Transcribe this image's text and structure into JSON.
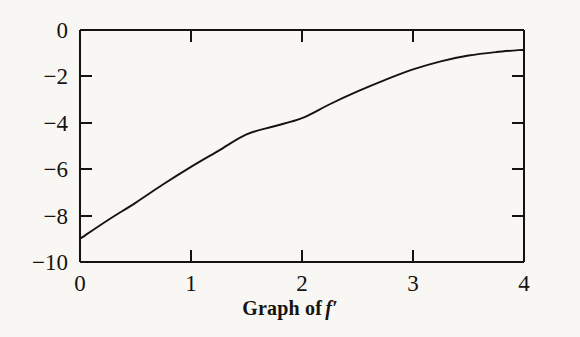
{
  "figure": {
    "background_color": "#f8f7f4",
    "ink_color": "#15130f",
    "caption_text": "Graph of",
    "caption_function": "f′"
  },
  "chart_data": {
    "type": "line",
    "xlabel": "",
    "ylabel": "",
    "xlim": [
      0,
      4
    ],
    "ylim": [
      -10,
      0
    ],
    "grid": false,
    "legend": null,
    "frame": "full-box",
    "tick_direction": "in",
    "x_ticks": [
      0,
      1,
      2,
      3,
      4
    ],
    "x_tick_labels": [
      "0",
      "1",
      "2",
      "3",
      "4"
    ],
    "y_ticks": [
      0,
      -2,
      -4,
      -6,
      -8,
      -10
    ],
    "y_tick_labels": [
      "0",
      "−2",
      "−4",
      "−6",
      "−8",
      "−10"
    ],
    "series": [
      {
        "name": "f′",
        "x": [
          0.0,
          0.25,
          0.5,
          0.75,
          1.0,
          1.25,
          1.5,
          1.75,
          2.0,
          2.25,
          2.5,
          2.75,
          3.0,
          3.25,
          3.5,
          3.75,
          4.0
        ],
        "y": [
          -9.0,
          -8.2,
          -7.45,
          -6.65,
          -5.9,
          -5.2,
          -4.5,
          -4.15,
          -3.8,
          -3.2,
          -2.65,
          -2.15,
          -1.7,
          -1.35,
          -1.1,
          -0.95,
          -0.85
        ]
      }
    ],
    "annotations": []
  },
  "axis_geometry": {
    "left_px": 80,
    "right_px": 524,
    "top_px": 30,
    "bottom_px": 262,
    "tick_length_px": 12
  }
}
